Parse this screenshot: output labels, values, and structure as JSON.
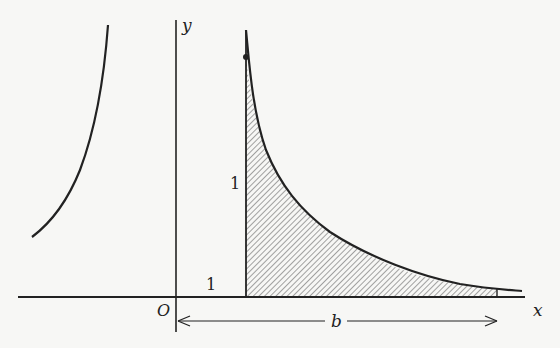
{
  "figure": {
    "type": "area under curve",
    "function": "y = 1/x^2",
    "axes": {
      "x_label": "x",
      "y_label": "y",
      "origin_label": "O"
    },
    "annotations": {
      "unit_x_label": "1",
      "unit_height_label": "1",
      "dimension_label": "b"
    },
    "shaded_region": {
      "from_x": 1,
      "to_x": "b",
      "pattern": "diagonal hatching"
    },
    "colors": {
      "ink": "#222222",
      "background": "#f7f7f5",
      "hatch": "#555555"
    }
  }
}
